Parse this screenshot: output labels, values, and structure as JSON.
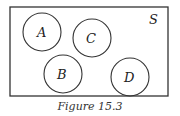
{
  "diagram": {
    "type": "venn",
    "universe": {
      "label": "S",
      "x": 10,
      "y": 7,
      "width": 158,
      "height": 89
    },
    "sets": [
      {
        "label": "A",
        "cx": 42,
        "cy": 32,
        "r": 19
      },
      {
        "label": "C",
        "cx": 92,
        "cy": 38,
        "r": 19
      },
      {
        "label": "B",
        "cx": 63,
        "cy": 74,
        "r": 19
      },
      {
        "label": "D",
        "cx": 130,
        "cy": 77,
        "r": 19
      }
    ],
    "caption": "Figure 15.3",
    "stroke_color": "#333333"
  }
}
